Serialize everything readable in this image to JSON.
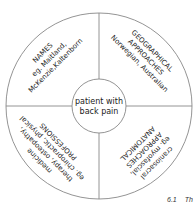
{
  "diagram": {
    "center_label": {
      "line1": "patient with",
      "line2": "back pain"
    },
    "quadrants": [
      {
        "position": "top-left",
        "title": "NAMES",
        "lines": [
          "eg. Maitland,",
          "McKenzie,Kaltenborn"
        ]
      },
      {
        "position": "top-right",
        "title": "GEOGRAPHICAL",
        "title2": "APPROACHES",
        "lines": [
          "Norwegian, Australian"
        ]
      },
      {
        "position": "bottom-left",
        "title": "PROFESSIONS",
        "lines": [
          "eg. chiropractic, physical",
          "therapy, osteopathy,",
          "medicine"
        ]
      },
      {
        "position": "bottom-right",
        "title": "ANATOMICAL",
        "title2": "APPROACHES",
        "lines": [
          "eg. myofascial,",
          "craniosacral"
        ]
      }
    ],
    "colors": {
      "stroke": "#888888",
      "text": "#222222",
      "background": "#ffffff"
    }
  },
  "caption": {
    "number": "6.1",
    "title": "Th"
  }
}
